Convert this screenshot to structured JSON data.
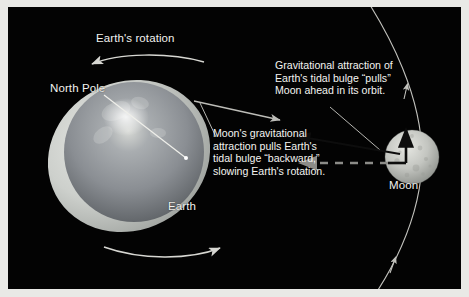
{
  "figure": {
    "kind": "astronomy-diagram",
    "background_color": "#030303",
    "frame_color": "#e9e9e6",
    "text_color": "#f2f2ef"
  },
  "labels": {
    "earths_rotation": "Earth's rotation",
    "north_pole": "North Pole",
    "earth": "Earth",
    "moon": "Moon"
  },
  "callouts": {
    "gravitational_pull": "Gravitational attraction of\nEarth's tidal bulge “pulls”\nMoon ahead in its orbit.",
    "moon_drag": "Moon's gravitational\nattraction pulls Earth's\ntidal bulge “backward,”\nslowing Earth's rotation."
  },
  "graphics": {
    "earth": {
      "name": "earth-sphere",
      "center_x": 124,
      "center_y": 148,
      "radius": 72,
      "body_color": "#8e9296",
      "bulge_color": "#cfd2cf",
      "bulge_tilt_degrees": -28,
      "highlight_color": "#f0f0ec"
    },
    "moon": {
      "name": "moon-sphere",
      "center_x": 404,
      "center_y": 150,
      "radius": 27,
      "body_color": "#c9cbc6",
      "crater_color": "#a6a8a3"
    },
    "orbit": {
      "name": "moon-orbit-arc",
      "stroke": "#c2c2bd",
      "stroke_width": 1.1,
      "arrow_count": 2
    },
    "rotation_arrow_top": {
      "name": "rotation-arrow-top",
      "direction": "left",
      "stroke": "#d7d7d2"
    },
    "rotation_arrow_bottom": {
      "name": "rotation-arrow-bottom",
      "direction": "right",
      "stroke": "#d7d7d2"
    },
    "bulge_force_arrow": {
      "name": "bulge-to-moon-force-arrow",
      "direction": "right",
      "stroke": "#bdbdb8"
    },
    "moon_force_arrow": {
      "name": "moon-pull-arrow",
      "direction": "left",
      "stroke": "#111111"
    },
    "moon_velocity_arrow": {
      "name": "moon-velocity-arrow",
      "direction": "up",
      "stroke": "#111111"
    },
    "moon_dashed_arrow": {
      "name": "moon-resultant-dashed-arrow",
      "direction": "left",
      "stroke": "#8c8c88",
      "dashed": true
    }
  }
}
